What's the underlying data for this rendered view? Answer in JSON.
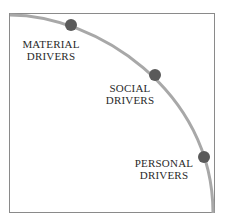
{
  "diagram": {
    "frame_color": "#8a8a8a",
    "arc_color": "#a8a8a8",
    "dot_color": "#5a5a5a",
    "nodes": [
      {
        "line1": "MATERIAL",
        "line2": "DRIVERS"
      },
      {
        "line1": "SOCIAL",
        "line2": "DRIVERS"
      },
      {
        "line1": "PERSONAL",
        "line2": "DRIVERS"
      }
    ]
  }
}
